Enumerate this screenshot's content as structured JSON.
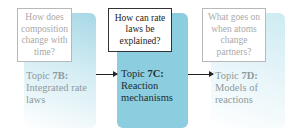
{
  "diagram": {
    "type": "flow",
    "colors": {
      "active_panel": "#8ccde0",
      "faded_panel": "#d3ecf3",
      "faded_text": "#a9a9a9",
      "active_text": "#222222"
    },
    "nodes": [
      {
        "id": "7B",
        "question": "How does composition change with time?",
        "topic_prefix": "Topic ",
        "topic_number": "7B:",
        "topic_title": "Integrated rate laws",
        "state": "faded"
      },
      {
        "id": "7C",
        "question": "How can rate laws be explained?",
        "topic_prefix": "Topic ",
        "topic_number": "7C:",
        "topic_title": "Reaction mechanisms",
        "state": "active"
      },
      {
        "id": "7D",
        "question": "What goes on when atoms change partners?",
        "topic_prefix": "Topic ",
        "topic_number": "7D:",
        "topic_title": "Models of reactions",
        "state": "faded"
      }
    ],
    "edges": [
      {
        "from": "7B",
        "to": "7C"
      },
      {
        "from": "7C",
        "to": "7D"
      }
    ]
  }
}
